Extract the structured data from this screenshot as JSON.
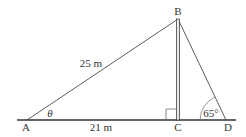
{
  "diagram": {
    "points": {
      "A": {
        "label": "A"
      },
      "B": {
        "label": "B"
      },
      "C": {
        "label": "C"
      },
      "D": {
        "label": "D"
      }
    },
    "lengths": {
      "AB": "25 m",
      "AC": "21 m"
    },
    "angles": {
      "A": "θ",
      "D": "65°"
    },
    "colors": {
      "line": "#333333",
      "pole": "#555555",
      "background": "#ffffff"
    }
  }
}
